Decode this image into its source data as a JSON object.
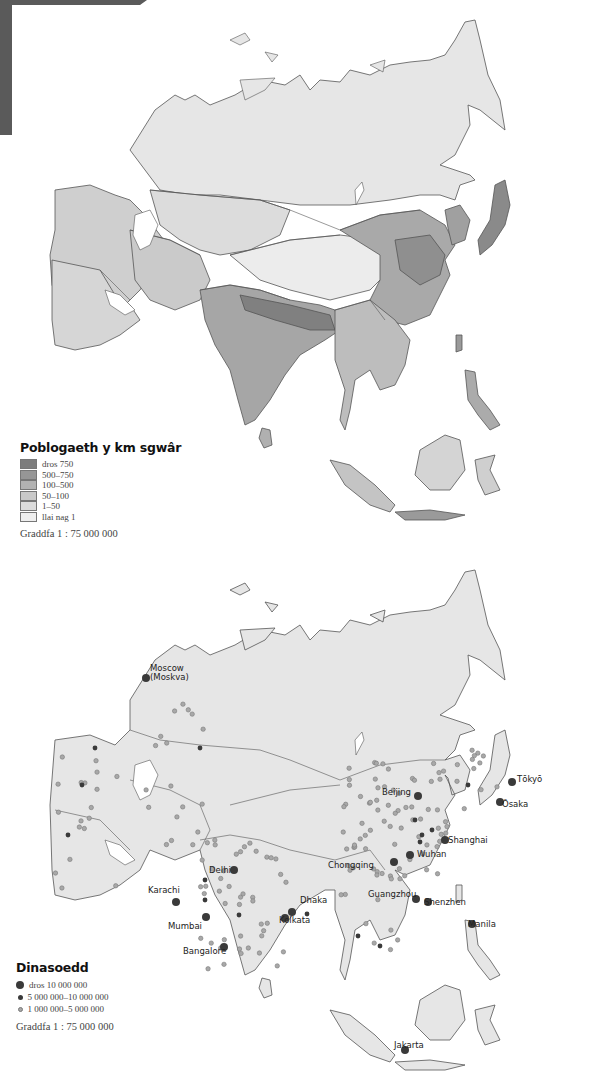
{
  "density_map": {
    "legend": {
      "title": "Poblogaeth y km sgwâr",
      "classes": [
        {
          "label": "dros 750",
          "color": "#7d7d7d"
        },
        {
          "label": "500–750",
          "color": "#969696"
        },
        {
          "label": "100–500",
          "color": "#b2b2b2"
        },
        {
          "label": "50–100",
          "color": "#c9c9c9"
        },
        {
          "label": "1–50",
          "color": "#dcdcdc"
        },
        {
          "label": "llai nag 1",
          "color": "#eeeeee"
        }
      ]
    },
    "scale": "Graddfa 1 : 75 000 000"
  },
  "cities_map": {
    "legend": {
      "title": "Dinasoedd",
      "classes": [
        {
          "label": "dros 10 000 000",
          "color": "#3a3a3a",
          "size": "large"
        },
        {
          "label": "5 000 000–10 000 000",
          "color": "#3a3a3a",
          "size": "medium"
        },
        {
          "label": "1 000 000–5 000 000",
          "color": "#a8a8a8",
          "size": "small"
        }
      ]
    },
    "scale": "Graddfa 1 : 75 000 000",
    "labelled_cities": [
      {
        "name": "Moscow\n(Moskva)",
        "class": "large"
      },
      {
        "name": "Beijing",
        "class": "large"
      },
      {
        "name": "Tōkyō",
        "class": "large"
      },
      {
        "name": "Ōsaka",
        "class": "large"
      },
      {
        "name": "Shanghai",
        "class": "large"
      },
      {
        "name": "Wuhan",
        "class": "large"
      },
      {
        "name": "Chongqing",
        "class": "large"
      },
      {
        "name": "Guangzhou",
        "class": "large"
      },
      {
        "name": "Shenzhen",
        "class": "large"
      },
      {
        "name": "Delhi",
        "class": "large"
      },
      {
        "name": "Karachi",
        "class": "large"
      },
      {
        "name": "Dhaka",
        "class": "large"
      },
      {
        "name": "Kolkata",
        "class": "large"
      },
      {
        "name": "Mumbai",
        "class": "large"
      },
      {
        "name": "Bangalore",
        "class": "large"
      },
      {
        "name": "Manila",
        "class": "large"
      },
      {
        "name": "Jakarta",
        "class": "large"
      }
    ]
  },
  "colors": {
    "land_cities": "#e6e6e6",
    "border": "#555555",
    "corner_tab": "#5a5a5a"
  }
}
